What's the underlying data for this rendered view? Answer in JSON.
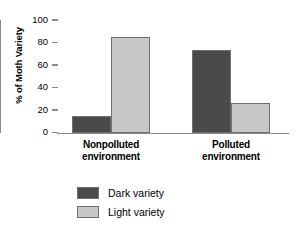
{
  "chart_data": {
    "type": "bar",
    "title": "",
    "xlabel": "",
    "ylabel": "% of Moth Variety",
    "ylim": [
      0,
      100
    ],
    "yticks": [
      0,
      20,
      40,
      60,
      80,
      100
    ],
    "grid": false,
    "legend_position": "bottom-left",
    "categories": [
      "Nonpolluted environment",
      "Polluted environment"
    ],
    "category_lines": [
      [
        "Nonpolluted",
        "environment"
      ],
      [
        "Polluted",
        "environment"
      ]
    ],
    "series": [
      {
        "name": "Dark variety",
        "color": "#4a4a4a",
        "values": [
          15,
          73
        ]
      },
      {
        "name": "Light variety",
        "color": "#c8c8c8",
        "values": [
          85,
          26
        ]
      }
    ]
  },
  "axis": {
    "y_title": "% of Moth Variety",
    "tick_labels": [
      "100",
      "80",
      "60",
      "40",
      "20",
      "0"
    ]
  },
  "legend": {
    "items": [
      {
        "label": "Dark variety",
        "color": "#4a4a4a"
      },
      {
        "label": "Light variety",
        "color": "#c8c8c8"
      }
    ]
  },
  "colors": {
    "dark_variety": "#4a4a4a",
    "light_variety": "#c8c8c8",
    "bar_border": "#6f6f6f",
    "axis": "#8a8a8a",
    "background": "#ffffff",
    "text": "#000000"
  }
}
